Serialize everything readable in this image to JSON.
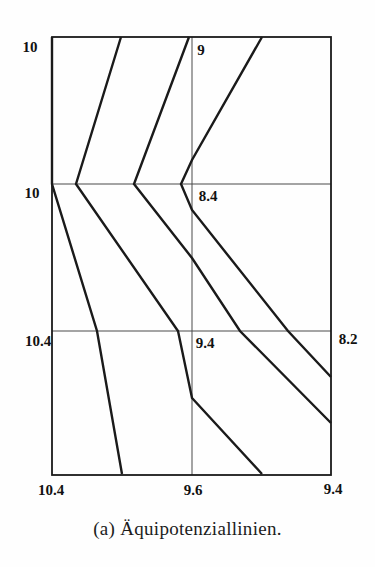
{
  "figure": {
    "caption": "(a) Äquipotenziallinien.",
    "background_color": "#fefefe",
    "line_color": "#1a1a1a",
    "grid_color": "#4a4a4a",
    "label_color": "#111111"
  },
  "chart_data": {
    "type": "line",
    "title": "(a) Äquipotenziallinien.",
    "legend": "none",
    "grid": "on",
    "plot_box": {
      "left": 52,
      "top": 37,
      "right": 331,
      "bottom": 475
    },
    "grid_lines": {
      "vertical_x": [
        192
      ],
      "horizontal_y": [
        184,
        331
      ]
    },
    "node_grid": {
      "columns_x": [
        52,
        192,
        331
      ],
      "rows_y": [
        37,
        184,
        331,
        475
      ],
      "potential_values": [
        [
          10,
          9,
          null
        ],
        [
          10,
          8.4,
          null
        ],
        [
          10.4,
          9.4,
          8.2
        ],
        [
          10.4,
          9.6,
          9.4
        ]
      ]
    },
    "series": [
      {
        "name": "equipotential-line-1",
        "points": [
          [
            52,
            37
          ],
          [
            52,
            184
          ],
          [
            97,
            331
          ],
          [
            122,
            474
          ]
        ]
      },
      {
        "name": "equipotential-line-2",
        "points": [
          [
            121,
            37
          ],
          [
            76,
            184
          ],
          [
            178,
            331
          ],
          [
            192,
            398
          ],
          [
            262,
            474
          ]
        ]
      },
      {
        "name": "equipotential-line-3",
        "points": [
          [
            189,
            37
          ],
          [
            134,
            184
          ],
          [
            192,
            258
          ],
          [
            240,
            331
          ],
          [
            331,
            423
          ]
        ]
      },
      {
        "name": "equipotential-line-4",
        "points": [
          [
            262,
            37
          ],
          [
            192,
            160
          ],
          [
            181,
            184
          ],
          [
            192,
            210
          ],
          [
            288,
            331
          ],
          [
            331,
            377
          ]
        ]
      }
    ],
    "node_labels": [
      {
        "text": "10",
        "x": 30,
        "y": 47
      },
      {
        "text": "9",
        "x": 201,
        "y": 50
      },
      {
        "text": "10",
        "x": 32,
        "y": 193
      },
      {
        "text": "8.4",
        "x": 208,
        "y": 196
      },
      {
        "text": "10.4",
        "x": 38,
        "y": 341
      },
      {
        "text": "9.4",
        "x": 205,
        "y": 343
      },
      {
        "text": "8.2",
        "x": 348,
        "y": 339
      },
      {
        "text": "10.4",
        "x": 51,
        "y": 490
      },
      {
        "text": "9.6",
        "x": 193,
        "y": 490
      },
      {
        "text": "9.4",
        "x": 333,
        "y": 489
      }
    ],
    "style": {
      "border_stroke_width": 1.8,
      "grid_stroke_width": 1,
      "contour_stroke_width": 2.4
    }
  }
}
